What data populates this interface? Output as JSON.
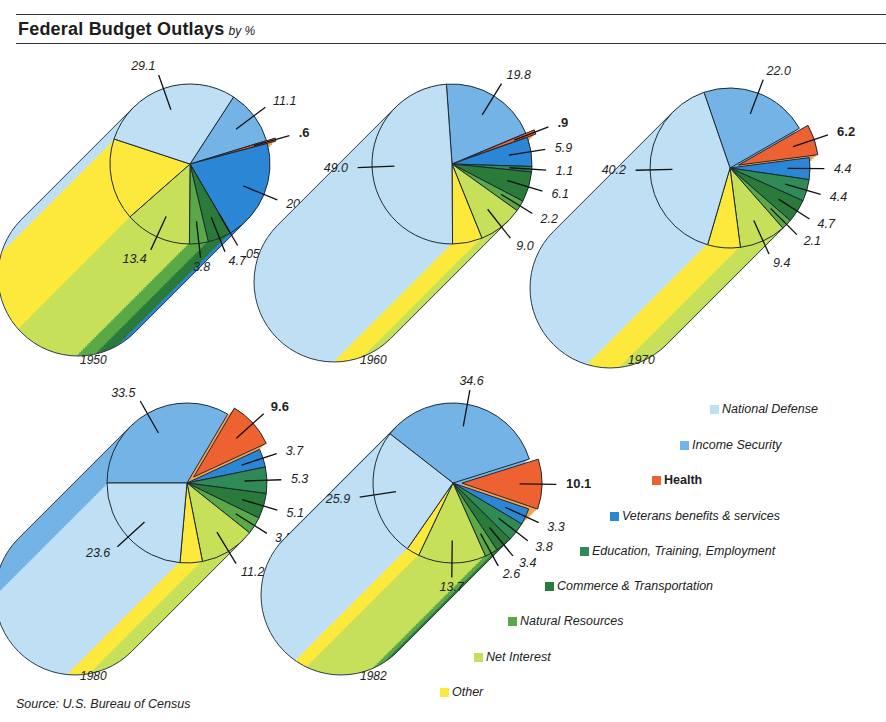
{
  "header": {
    "title": "Federal Budget Outlays",
    "subtitle": "by %"
  },
  "source": "Source: U.S. Bureau of Census",
  "colors": {
    "National Defense": "#bfe0f4",
    "Income Security": "#74b3e6",
    "Health": "#ee6232",
    "Health Side": "#f3a24e",
    "Veterans benefits & services": "#2c86d6",
    "Education, Training, Employment": "#2f8a55",
    "Commerce & Transportation": "#2a7a3a",
    "Natural Resources": "#5aa847",
    "Net Interest": "#c6e05a",
    "Other": "#fde93c"
  },
  "legend": [
    {
      "label": "National Defense",
      "bold": false
    },
    {
      "label": "Income Security",
      "bold": false
    },
    {
      "label": "Health",
      "bold": true
    },
    {
      "label": "Veterans benefits & services",
      "bold": false
    },
    {
      "label": "Education, Training, Employment",
      "bold": false
    },
    {
      "label": "Commerce & Transportation",
      "bold": false
    },
    {
      "label": "Natural Resources",
      "bold": false
    },
    {
      "label": "Net Interest",
      "bold": false
    },
    {
      "label": "Other",
      "bold": false
    }
  ],
  "chart_data": [
    {
      "type": "pie",
      "title": "1950",
      "categories": [
        "Income Security",
        "Health",
        "Veterans benefits & services",
        "Education, Training, Employment",
        "Commerce & Transportation",
        "Natural Resources",
        "Net Interest",
        "Other",
        "National Defense"
      ],
      "values": [
        11.1,
        0.6,
        20.7,
        0.05,
        4.7,
        3.8,
        13.4,
        null,
        29.1
      ],
      "labels": [
        "11.1",
        ".6",
        "20.7",
        ".05",
        "4.7",
        "3.8",
        "13.4",
        "",
        "29.1"
      ],
      "exploded": "Health"
    },
    {
      "type": "pie",
      "title": "1960",
      "categories": [
        "Income Security",
        "Health",
        "Veterans benefits & services",
        "Education, Training, Employment",
        "Commerce & Transportation",
        "Natural Resources",
        "Net Interest",
        "Other",
        "National Defense"
      ],
      "values": [
        19.8,
        0.9,
        5.9,
        1.1,
        6.1,
        2.2,
        9.0,
        null,
        49.0
      ],
      "labels": [
        "19.8",
        ".9",
        "5.9",
        "1.1",
        "6.1",
        "2.2",
        "9.0",
        "",
        "49.0"
      ],
      "exploded": "Health"
    },
    {
      "type": "pie",
      "title": "1970",
      "categories": [
        "Income Security",
        "Health",
        "Veterans benefits & services",
        "Education, Training, Employment",
        "Commerce & Transportation",
        "Natural Resources",
        "Net Interest",
        "Other",
        "National Defense"
      ],
      "values": [
        22.0,
        6.2,
        4.4,
        4.4,
        4.7,
        2.1,
        9.4,
        null,
        40.2
      ],
      "labels": [
        "22.0",
        "6.2",
        "4.4",
        "4.4",
        "4.7",
        "2.1",
        "9.4",
        "",
        "40.2"
      ],
      "exploded": "Health"
    },
    {
      "type": "pie",
      "title": "1980",
      "categories": [
        "Income Security",
        "Health",
        "Veterans benefits & services",
        "Education, Training, Employment",
        "Commerce & Transportation",
        "Natural Resources",
        "Net Interest",
        "Other",
        "National Defense"
      ],
      "values": [
        33.5,
        9.6,
        3.7,
        5.3,
        5.1,
        3.5,
        11.2,
        null,
        23.6
      ],
      "labels": [
        "33.5",
        "9.6",
        "3.7",
        "5.3",
        "5.1",
        "3.5",
        "11.2",
        "",
        "23.6"
      ],
      "exploded": "Health"
    },
    {
      "type": "pie",
      "title": "1982",
      "categories": [
        "Income Security",
        "Health",
        "Veterans benefits & services",
        "Education, Training, Employment",
        "Commerce & Transportation",
        "Natural Resources",
        "Net Interest",
        "Other",
        "National Defense"
      ],
      "values": [
        34.6,
        10.1,
        3.3,
        3.8,
        3.4,
        2.6,
        13.7,
        null,
        25.9
      ],
      "labels": [
        "34.6",
        "10.1",
        "3.3",
        "3.8",
        "3.4",
        "2.6",
        "13.7",
        "",
        "25.9"
      ],
      "exploded": "Health"
    }
  ],
  "layout": [
    {
      "cx": 190,
      "cy": 164,
      "r": 80,
      "dx": -112,
      "dy": 112,
      "start": -57,
      "yearX": 80,
      "yearY": 364
    },
    {
      "cx": 452,
      "cy": 164,
      "r": 80,
      "dx": -118,
      "dy": 118,
      "start": -94,
      "yearX": 360,
      "yearY": 364
    },
    {
      "cx": 730,
      "cy": 168,
      "r": 80,
      "dx": -120,
      "dy": 120,
      "start": -109,
      "yearX": 628,
      "yearY": 364
    },
    {
      "cx": 187,
      "cy": 483,
      "r": 80,
      "dx": -112,
      "dy": 112,
      "start": -180,
      "yearX": 80,
      "yearY": 680
    },
    {
      "cx": 453,
      "cy": 483,
      "r": 80,
      "dx": -112,
      "dy": 112,
      "start": -142,
      "yearX": 360,
      "yearY": 680
    }
  ]
}
